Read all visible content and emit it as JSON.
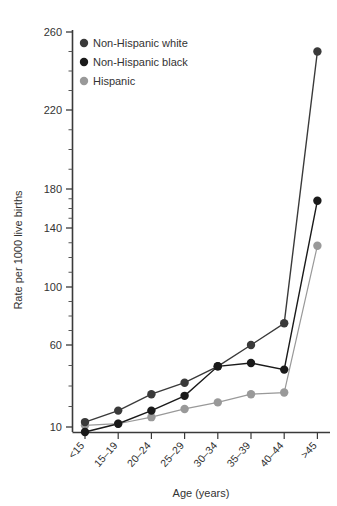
{
  "chart_data": {
    "type": "line",
    "title": "",
    "xlabel": "Age (years)",
    "ylabel": "Rate per 1000 live births",
    "categories": [
      "<15",
      "15–19",
      "20–24",
      "25–29",
      "30–34",
      "35–39",
      "40–44",
      ">45"
    ],
    "ytick_labels": [
      "10",
      "60",
      "100",
      "140",
      "180",
      "220",
      "260"
    ],
    "ytick_values": [
      10,
      60,
      100,
      140,
      180,
      220,
      260
    ],
    "ylim": [
      4,
      268
    ],
    "grid": false,
    "legend_position": "top-left",
    "series": [
      {
        "name": "Non-Hispanic white",
        "color": "#3a3a3a",
        "values": [
          13,
          20,
          30,
          37,
          47,
          60,
          75,
          250
        ]
      },
      {
        "name": "Non-Hispanic black",
        "color": "#1a1a1a",
        "values": [
          4,
          12,
          20,
          29,
          47,
          49,
          45,
          168
        ]
      },
      {
        "name": "Hispanic",
        "color": "#999999",
        "values": [
          11,
          12,
          16,
          21,
          25,
          30,
          31,
          128
        ]
      }
    ]
  },
  "legend": {
    "items": [
      {
        "label": "Non-Hispanic white",
        "color": "#3a3a3a",
        "marker": "dot-icon"
      },
      {
        "label": "Non-Hispanic black",
        "color": "#1a1a1a",
        "marker": "dot-icon"
      },
      {
        "label": "Hispanic",
        "color": "#999999",
        "marker": "dot-icon"
      }
    ]
  },
  "axes": {
    "x_title": "Age (years)",
    "y_title": "Rate per 1000 live births",
    "x_labels": [
      "<15",
      "15–19",
      "20–24",
      "25–29",
      "30–34",
      "35–39",
      "40–44",
      ">45"
    ],
    "y_labels": [
      "260",
      "220",
      "180",
      "140",
      "100",
      "60",
      "10"
    ]
  }
}
